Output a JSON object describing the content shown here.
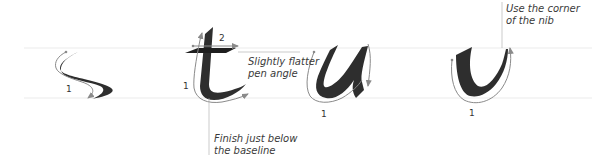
{
  "diagram": {
    "colors": {
      "background": "#ffffff",
      "guideline": "#ececec",
      "ink": "#2e2e2e",
      "arrow": "#8a8a8a",
      "text": "#3a3a3a"
    },
    "guidelines": {
      "x_height_y": 47,
      "baseline_y": 97
    },
    "letters": [
      {
        "char": "s",
        "strokes": [
          {
            "number": "1"
          }
        ]
      },
      {
        "char": "t",
        "strokes": [
          {
            "number": "1"
          },
          {
            "number": "2"
          }
        ]
      },
      {
        "char": "u",
        "strokes": [
          {
            "number": "1"
          }
        ]
      },
      {
        "char": "v",
        "strokes": [
          {
            "number": "1"
          }
        ]
      }
    ],
    "annotations": {
      "t_crossbar": {
        "line1": "Slightly flatter",
        "line2": "pen angle"
      },
      "t_finish": {
        "line1": "Finish just below",
        "line2": "the baseline"
      },
      "v_corner": {
        "line1": "Use the corner",
        "line2": "of the nib"
      }
    }
  }
}
